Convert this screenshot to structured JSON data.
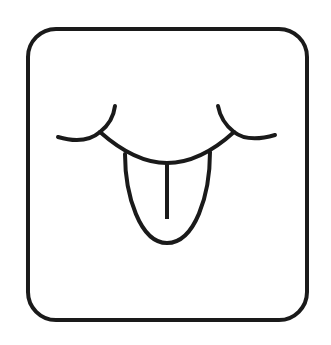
{
  "icon": {
    "name": "face-with-tongue",
    "description": "Closed-eyes face sticking out tongue inside a rounded square",
    "stroke_color": "#1a1a1a",
    "background_color": "#ffffff"
  }
}
